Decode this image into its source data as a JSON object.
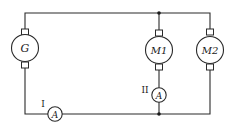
{
  "diagram": {
    "components": {
      "generator": {
        "label": "G",
        "type": "dc-machine"
      },
      "motor1": {
        "label": "M1",
        "type": "dc-machine"
      },
      "motor2": {
        "label": "M2",
        "type": "dc-machine"
      },
      "ammeter1": {
        "label": "A",
        "position_label": "I",
        "type": "ammeter"
      },
      "ammeter2": {
        "label": "A",
        "position_label": "II",
        "type": "ammeter"
      }
    },
    "colors": {
      "line": "#2a2a2a",
      "background": "#ffffff"
    }
  }
}
